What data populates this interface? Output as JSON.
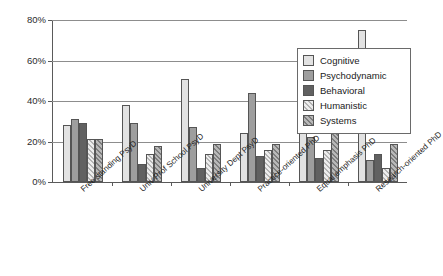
{
  "chart_data": {
    "type": "bar",
    "title": "",
    "xlabel": "",
    "ylabel": "",
    "ylim": [
      0,
      80
    ],
    "grid": true,
    "legend_position": "right",
    "ytick_labels": [
      "80%",
      "60%",
      "40%",
      "20%",
      "0%"
    ],
    "ytick_values": [
      80,
      60,
      40,
      20,
      0
    ],
    "categories": [
      "Free standing PsyD",
      "Univ Prof School PsyD",
      "University Dept PsyD",
      "Practice-oriented PhD",
      "Equal emphasis PhD",
      "Research-oriented PhD"
    ],
    "series": [
      {
        "name": "Cognitive",
        "color": "#e2e2e2",
        "values": [
          28,
          38,
          51,
          24,
          61,
          75
        ]
      },
      {
        "name": "Psychodynamic",
        "color": "#9e9e9e",
        "values": [
          31,
          29,
          27,
          44,
          22,
          11
        ]
      },
      {
        "name": "Behavioral",
        "color": "#616161",
        "values": [
          29,
          9,
          7,
          13,
          12,
          14
        ]
      },
      {
        "name": "Humanistic",
        "color": "#ededed",
        "values": [
          21,
          14,
          14,
          16,
          16,
          7
        ]
      },
      {
        "name": "Systems",
        "color": "#b8b8b8",
        "values": [
          21,
          18,
          19,
          19,
          26,
          19
        ]
      }
    ]
  }
}
